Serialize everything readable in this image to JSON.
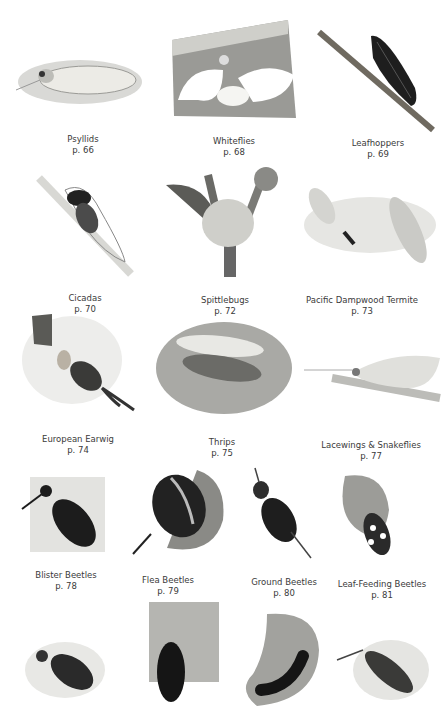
{
  "page": {
    "rows": [
      [
        {
          "name": "Psyllids",
          "page": "p. 66",
          "icon": "psyllid-illustration"
        },
        {
          "name": "Whiteflies",
          "page": "p. 68",
          "icon": "whitefly-illustration"
        },
        {
          "name": "Leafhoppers",
          "page": "p. 69",
          "icon": "leafhopper-illustration"
        }
      ],
      [
        {
          "name": "Cicadas",
          "page": "p. 70",
          "icon": "cicada-illustration"
        },
        {
          "name": "Spittlebugs",
          "page": "p. 72",
          "icon": "spittlebug-illustration"
        },
        {
          "name": "Pacific Dampwood Termite",
          "page": "p. 73",
          "icon": "termite-illustration"
        }
      ],
      [
        {
          "name": "European Earwig",
          "page": "p. 74",
          "icon": "earwig-illustration"
        },
        {
          "name": "Thrips",
          "page": "p. 75",
          "icon": "thrips-illustration"
        },
        {
          "name": "Lacewings & Snakeflies",
          "page": "p. 77",
          "icon": "lacewing-illustration"
        }
      ],
      [
        {
          "name": "Blister Beetles",
          "page": "p. 78",
          "icon": "blister-beetle-illustration"
        },
        {
          "name": "Flea Beetles",
          "page": "p. 79",
          "icon": "flea-beetle-illustration"
        },
        {
          "name": "Ground Beetles",
          "page": "p. 80",
          "icon": "ground-beetle-illustration"
        },
        {
          "name": "Leaf-Feeding Beetles",
          "page": "p. 81",
          "icon": "leaf-beetle-illustration"
        }
      ],
      [
        {
          "icon": "weevil-illustration"
        },
        {
          "icon": "bark-beetle-illustration"
        },
        {
          "icon": "larva-illustration"
        },
        {
          "icon": "click-beetle-illustration"
        }
      ]
    ]
  }
}
